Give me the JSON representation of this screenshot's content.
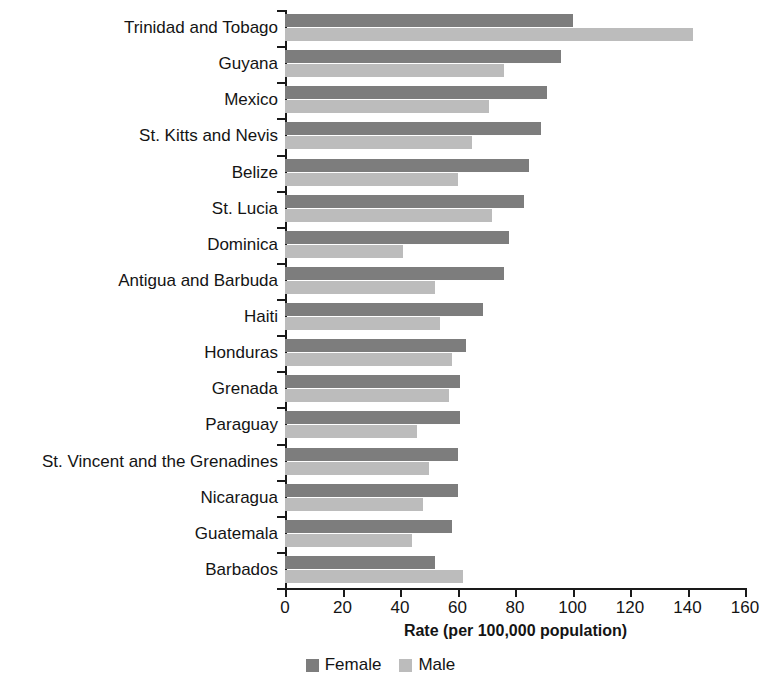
{
  "chart_data": {
    "type": "bar",
    "orientation": "horizontal",
    "title": "",
    "xlabel": "Rate (per 100,000 population)",
    "ylabel": "",
    "xlim": [
      0,
      160
    ],
    "xticks": [
      0,
      20,
      40,
      60,
      80,
      100,
      120,
      140,
      160
    ],
    "grid": false,
    "legend_position": "bottom",
    "categories": [
      "Trinidad and Tobago",
      "Guyana",
      "Mexico",
      "St. Kitts and Nevis",
      "Belize",
      "St. Lucia",
      "Dominica",
      "Antigua and Barbuda",
      "Haiti",
      "Honduras",
      "Grenada",
      "Paraguay",
      "St. Vincent and the Grenadines",
      "Nicaragua",
      "Guatemala",
      "Barbados"
    ],
    "series": [
      {
        "name": "Female",
        "color": "#7d7d7d",
        "values": [
          100,
          96,
          91,
          89,
          85,
          83,
          78,
          76,
          69,
          63,
          61,
          61,
          60,
          60,
          58,
          52
        ]
      },
      {
        "name": "Male",
        "color": "#bcbcbc",
        "values": [
          142,
          76,
          71,
          65,
          60,
          72,
          41,
          52,
          54,
          58,
          57,
          46,
          50,
          48,
          44,
          62
        ]
      }
    ]
  },
  "legend": {
    "entries": [
      {
        "label": "Female",
        "color": "#7d7d7d"
      },
      {
        "label": "Male",
        "color": "#bcbcbc"
      }
    ]
  }
}
